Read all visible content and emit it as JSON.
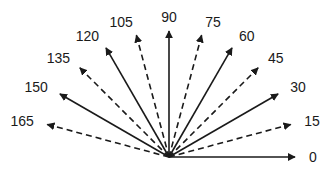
{
  "diagram": {
    "origin": {
      "x": 169,
      "y": 157
    },
    "arrow_length": 126,
    "label_radius": 140,
    "color": "#1a1a1a",
    "arrows": [
      {
        "angle": 0,
        "label": "0",
        "style": "solid"
      },
      {
        "angle": 15,
        "label": "15",
        "style": "dashed"
      },
      {
        "angle": 30,
        "label": "30",
        "style": "solid"
      },
      {
        "angle": 45,
        "label": "45",
        "style": "dashed"
      },
      {
        "angle": 60,
        "label": "60",
        "style": "solid"
      },
      {
        "angle": 75,
        "label": "75",
        "style": "dashed"
      },
      {
        "angle": 90,
        "label": "90",
        "style": "solid"
      },
      {
        "angle": 105,
        "label": "105",
        "style": "dashed"
      },
      {
        "angle": 120,
        "label": "120",
        "style": "solid"
      },
      {
        "angle": 135,
        "label": "135",
        "style": "dashed"
      },
      {
        "angle": 150,
        "label": "150",
        "style": "solid"
      },
      {
        "angle": 165,
        "label": "165",
        "style": "dashed"
      }
    ]
  }
}
